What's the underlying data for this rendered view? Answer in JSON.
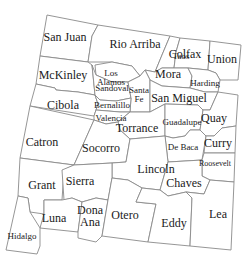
{
  "map": {
    "state": "New Mexico",
    "style": {
      "fill": "#ffffff",
      "border_color": "#8a8a8a",
      "text_color": "#1a1a1a"
    },
    "counties": [
      {
        "id": "san-juan",
        "label": "San Juan",
        "x": 65,
        "y": 37,
        "size": "lg"
      },
      {
        "id": "rio-arriba",
        "label": "Rio Arriba",
        "x": 135,
        "y": 44,
        "size": "lg"
      },
      {
        "id": "taos",
        "label": "Taos",
        "x": 181,
        "y": 56,
        "size": "sm"
      },
      {
        "id": "colfax",
        "label": "Colfax",
        "x": 185,
        "y": 54,
        "size": "lg"
      },
      {
        "id": "union",
        "label": "Union",
        "x": 222,
        "y": 59,
        "size": "lg"
      },
      {
        "id": "mckinley",
        "label": "McKinley",
        "x": 63,
        "y": 75,
        "size": "lg"
      },
      {
        "id": "los-alamos",
        "label": "Los\nAlamos",
        "x": 111,
        "y": 78,
        "size": "sm"
      },
      {
        "id": "sandoval",
        "label": "Sandoval",
        "x": 112,
        "y": 88,
        "size": "sm"
      },
      {
        "id": "mora",
        "label": "Mora",
        "x": 168,
        "y": 74,
        "size": "lg"
      },
      {
        "id": "harding",
        "label": "Harding",
        "x": 205,
        "y": 83,
        "size": "sm"
      },
      {
        "id": "santa-fe",
        "label": "Santa\nFe",
        "x": 139,
        "y": 95,
        "size": "sm"
      },
      {
        "id": "san-miguel",
        "label": "San Miguel",
        "x": 179,
        "y": 98,
        "size": "lg"
      },
      {
        "id": "cibola",
        "label": "Cibola",
        "x": 63,
        "y": 105,
        "size": "lg"
      },
      {
        "id": "bernalillo",
        "label": "Bernalillo",
        "x": 112,
        "y": 105,
        "size": "sm"
      },
      {
        "id": "valencia",
        "label": "Valencia",
        "x": 111,
        "y": 118,
        "size": "sm"
      },
      {
        "id": "torrance",
        "label": "Torrance",
        "x": 137,
        "y": 128,
        "size": "lg"
      },
      {
        "id": "guadalupe",
        "label": "Guadalupe",
        "x": 182,
        "y": 122,
        "size": "sm"
      },
      {
        "id": "quay",
        "label": "Quay",
        "x": 214,
        "y": 118,
        "size": "lg"
      },
      {
        "id": "catron",
        "label": "Catron",
        "x": 42,
        "y": 142,
        "size": "lg"
      },
      {
        "id": "socorro",
        "label": "Socorro",
        "x": 101,
        "y": 148,
        "size": "lg"
      },
      {
        "id": "de-baca",
        "label": "De Baca",
        "x": 183,
        "y": 147,
        "size": "sm"
      },
      {
        "id": "curry",
        "label": "Curry",
        "x": 218,
        "y": 143,
        "size": "lg"
      },
      {
        "id": "roosevelt",
        "label": "Roosevelt",
        "x": 215,
        "y": 164,
        "size": "xs"
      },
      {
        "id": "lincoln",
        "label": "Lincoln",
        "x": 156,
        "y": 169,
        "size": "lg"
      },
      {
        "id": "grant",
        "label": "Grant",
        "x": 42,
        "y": 185,
        "size": "lg"
      },
      {
        "id": "sierra",
        "label": "Sierra",
        "x": 80,
        "y": 181,
        "size": "lg"
      },
      {
        "id": "chaves",
        "label": "Chaves",
        "x": 184,
        "y": 183,
        "size": "lg"
      },
      {
        "id": "luna",
        "label": "Luna",
        "x": 54,
        "y": 218,
        "size": "lg"
      },
      {
        "id": "dona-ana",
        "label": "Dona\nAna",
        "x": 90,
        "y": 216,
        "size": "lg"
      },
      {
        "id": "otero",
        "label": "Otero",
        "x": 125,
        "y": 215,
        "size": "lg"
      },
      {
        "id": "eddy",
        "label": "Eddy",
        "x": 174,
        "y": 223,
        "size": "lg"
      },
      {
        "id": "lea",
        "label": "Lea",
        "x": 218,
        "y": 214,
        "size": "lg"
      },
      {
        "id": "hidalgo",
        "label": "Hidalgo",
        "x": 22,
        "y": 236,
        "size": "sm"
      }
    ]
  }
}
